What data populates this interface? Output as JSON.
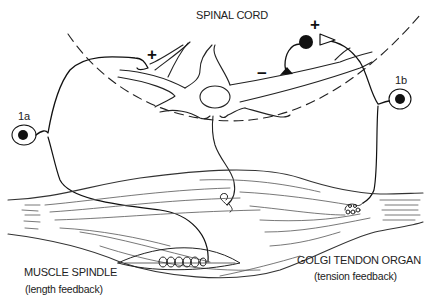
{
  "diagram": {
    "regions": {
      "spinal_cord": "SPINAL CORD"
    },
    "afferents": {
      "ia": "1a",
      "ib": "1b"
    },
    "synapse_signs": {
      "ia_excitatory": "+",
      "ib_excitatory": "+",
      "ib_inhibitory": "−"
    },
    "receptors": {
      "muscle_spindle": {
        "name": "MUSCLE SPINDLE",
        "function": "(length feedback)"
      },
      "golgi_tendon_organ": {
        "name": "GOLGI TENDON ORGAN",
        "function": "(tension feedback)"
      }
    },
    "colors": {
      "ink": "#111111",
      "fiber": "#444444",
      "background": "#ffffff"
    }
  }
}
